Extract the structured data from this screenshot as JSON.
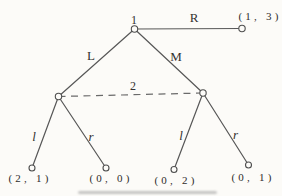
{
  "diagram": {
    "type": "extensive-form-game-tree",
    "player_labels": {
      "player1": "1",
      "player2": "2"
    },
    "actions": {
      "root": {
        "L": "L",
        "M": "M",
        "R": "R"
      },
      "info_set_left": {
        "l": "l",
        "r": "r"
      },
      "info_set_right": {
        "l": "l",
        "r": "r"
      }
    },
    "payoffs": {
      "after_R": "(1, 3)",
      "after_L_l": "(2, 1)",
      "after_L_r": "(0, 0)",
      "after_M_l": "(0, 2)",
      "after_M_r": "(0, 1)"
    },
    "colors": {
      "line": "#575757",
      "text": "#333130",
      "background": "#fcfbf8"
    }
  }
}
